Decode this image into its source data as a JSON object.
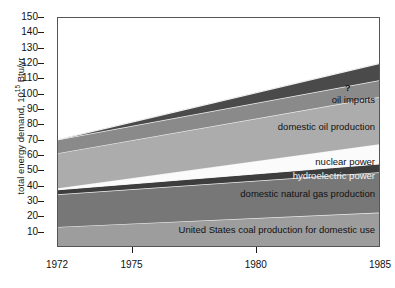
{
  "chart_data": {
    "type": "area",
    "title": "",
    "xlabel": "",
    "ylabel": "total energy demand, 10¹⁵ Btu/yr",
    "ylabel_prefix": "total energy demand, 10",
    "ylabel_exponent": "15",
    "ylabel_suffix": " Btu/yr",
    "xlim": [
      1972,
      1985
    ],
    "ylim": [
      0,
      150
    ],
    "x_ticks": [
      1972,
      1975,
      1980,
      1985
    ],
    "x_tick_labels": [
      "1972",
      "1975",
      "1980",
      "1985"
    ],
    "y_ticks": [
      0,
      10,
      20,
      30,
      40,
      50,
      60,
      70,
      80,
      90,
      100,
      110,
      120,
      130,
      140,
      150
    ],
    "y_tick_labels": [
      "",
      "10",
      "20",
      "30",
      "40",
      "50",
      "60",
      "70",
      "80",
      "90",
      "100",
      "110",
      "120",
      "130",
      "140",
      "150"
    ],
    "grid": false,
    "legend": "inline-band-labels",
    "stacked": true,
    "x": [
      1972,
      1985
    ],
    "series": [
      {
        "name": "United States coal production for domestic use",
        "label": "United States coal production for domestic use",
        "values": [
          12.5,
          22.0
        ],
        "color": "#9d9d9d",
        "label_color": "dark"
      },
      {
        "name": "domestic natural gas production",
        "label": "domestic natural gas production",
        "values": [
          21.5,
          26.5
        ],
        "color": "#777777",
        "label_color": "dark"
      },
      {
        "name": "hydroelectric power",
        "label": "hydroelectric power",
        "values": [
          3.0,
          5.5
        ],
        "color": "#3d3d3d",
        "label_color": "light"
      },
      {
        "name": "nuclear power",
        "label": "nuclear power",
        "values": [
          1.0,
          13.0
        ],
        "color": "#fbfbfb",
        "label_color": "dark"
      },
      {
        "name": "domestic oil production",
        "label": "domestic oil production",
        "values": [
          23.0,
          31.0
        ],
        "color": "#acacac",
        "label_color": "dark"
      },
      {
        "name": "oil imports",
        "label": "oil imports",
        "values": [
          9.0,
          11.0
        ],
        "color": "#8a8a8a",
        "label_color": "dark"
      },
      {
        "name": "unmet demand",
        "label": "?",
        "values": [
          0.0,
          11.0
        ],
        "color": "#4a4a4a",
        "label_color": "dark"
      }
    ],
    "annotations": [
      {
        "text": "?",
        "x": 1983.7,
        "y": 104.0
      }
    ],
    "band_label_anchors": [
      {
        "series": "oil imports",
        "x": 1985,
        "y": 96.5
      },
      {
        "series": "domestic oil production",
        "x": 1985,
        "y": 79.0
      },
      {
        "series": "nuclear power",
        "x": 1985,
        "y": 56.0
      },
      {
        "series": "hydroelectric power",
        "x": 1985,
        "y": 47.0
      },
      {
        "series": "domestic natural gas production",
        "x": 1985,
        "y": 35.0
      },
      {
        "series": "United States coal production for domestic use",
        "x": 1985,
        "y": 11.5
      }
    ],
    "colors": {
      "axis": "#1a1a1a",
      "frame": "#555555",
      "band_separator": "#f0f0f0",
      "background": "#ffffff"
    }
  }
}
